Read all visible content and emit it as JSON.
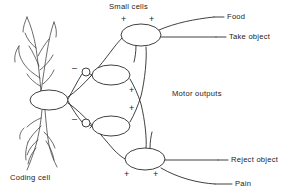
{
  "figure": {
    "type": "neural-circuit-diagram",
    "background_color": "#ffffff",
    "ink_color": "#2b2b2b",
    "width": 292,
    "height": 195
  },
  "labels": {
    "small_cells": "Small cells",
    "coding_cell": "Coding cell",
    "motor_outputs": "Motor outputs",
    "food": "Food",
    "take_object": "Take object",
    "reject_object": "Reject object",
    "pain": "Pain"
  },
  "signs": {
    "top_cell_left": "+",
    "top_cell_right": "+",
    "upper_middle_inhibitory": "–",
    "upper_middle_excitatory": "+",
    "lower_middle_inhibitory": "–",
    "lower_middle_excitatory": "+",
    "bottom_cell_left": "+",
    "bottom_cell_right": "+"
  },
  "cells": [
    {
      "name": "coding-cell",
      "role": "input-coding-neuron",
      "cx": 49,
      "cy": 100,
      "rx": 19,
      "ry": 10
    },
    {
      "name": "small-cell-top",
      "role": "motor-output-food",
      "cx": 141,
      "cy": 35,
      "rx": 20,
      "ry": 11
    },
    {
      "name": "small-cell-upper-middle",
      "role": "interneuron",
      "cx": 111,
      "cy": 75,
      "rx": 19,
      "ry": 10
    },
    {
      "name": "small-cell-lower-middle",
      "role": "interneuron",
      "cx": 111,
      "cy": 126,
      "rx": 19,
      "ry": 10
    },
    {
      "name": "small-cell-bottom",
      "role": "motor-output-reject",
      "cx": 145,
      "cy": 159,
      "rx": 20,
      "ry": 11
    }
  ],
  "synapses": [
    {
      "name": "inhibitory-synapse-upper",
      "sign": "–",
      "cx": 86,
      "cy": 72
    },
    {
      "name": "inhibitory-synapse-lower",
      "sign": "–",
      "cx": 86,
      "cy": 123
    }
  ],
  "outputs": [
    {
      "name": "output-food",
      "label": "Food"
    },
    {
      "name": "output-take-object",
      "label": "Take object"
    },
    {
      "name": "output-reject-object",
      "label": "Reject object"
    },
    {
      "name": "output-pain",
      "label": "Pain"
    }
  ]
}
